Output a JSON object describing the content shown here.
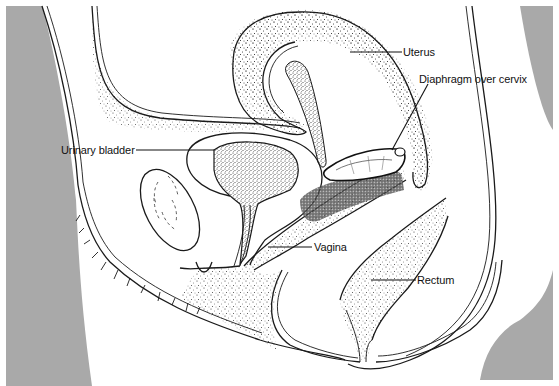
{
  "diagram": {
    "title": "",
    "colors": {
      "background": "#ffffff",
      "body_exterior_gray": "#a9a9a9",
      "line": "#1a1a1a",
      "stipple": "#333333"
    },
    "labels": [
      {
        "id": "uterus",
        "text": "Uterus"
      },
      {
        "id": "diaphragm",
        "text": "Diaphragm over cervix"
      },
      {
        "id": "bladder",
        "text": "Urinary bladder"
      },
      {
        "id": "vagina",
        "text": "Vagina"
      },
      {
        "id": "rectum",
        "text": "Rectum"
      }
    ]
  }
}
